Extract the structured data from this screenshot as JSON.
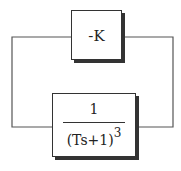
{
  "diagram": {
    "type": "block-diagram-feedback-loop",
    "gain_block": {
      "label": "-K"
    },
    "transfer_function_block": {
      "numerator": "1",
      "denominator_base": "(Ts+1)",
      "denominator_exponent": "3"
    },
    "colors": {
      "line": "#555555",
      "border": "#333333",
      "background": "#ffffff"
    }
  }
}
